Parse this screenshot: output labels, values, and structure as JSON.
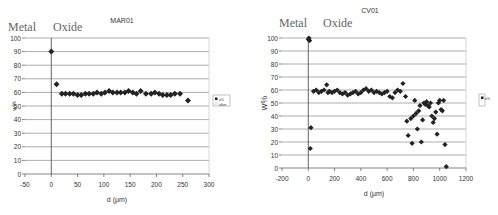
{
  "chart_data": [
    {
      "type": "scatter",
      "title": "MAR01",
      "xlabel": "d (µm)",
      "ylabel": "w%",
      "xlim": [
        -50,
        300
      ],
      "ylim": [
        0,
        100
      ],
      "xticks": [
        -50,
        0,
        50,
        100,
        150,
        200,
        250,
        300
      ],
      "yticks": [
        0,
        10,
        20,
        30,
        40,
        50,
        60,
        70,
        80,
        90,
        100
      ],
      "grid": true,
      "legend_position": "right",
      "legend": [
        "w%",
        "offset"
      ],
      "annotations": [
        "Metal",
        "Oxide"
      ],
      "series": [
        {
          "name": "w%",
          "x": [
            0,
            10,
            20,
            27,
            35,
            42,
            50,
            57,
            65,
            72,
            80,
            87,
            95,
            102,
            110,
            117,
            125,
            132,
            140,
            147,
            155,
            162,
            170,
            180,
            190,
            197,
            205,
            212,
            220,
            227,
            235,
            245,
            260
          ],
          "y": [
            90,
            66,
            59,
            59,
            59,
            59,
            58,
            58,
            59,
            59,
            59,
            60,
            59,
            60,
            61,
            60,
            60,
            60,
            60,
            61,
            60,
            59,
            61,
            59,
            59,
            60,
            59,
            58,
            58,
            58,
            59,
            59,
            54
          ]
        }
      ]
    },
    {
      "type": "scatter",
      "title": "CV01",
      "xlabel": "d (µm)",
      "ylabel": "w%",
      "xlim": [
        -200,
        1200
      ],
      "ylim": [
        0,
        100
      ],
      "xticks": [
        -200,
        0,
        200,
        400,
        600,
        800,
        1000,
        1200
      ],
      "yticks": [
        0,
        10,
        20,
        30,
        40,
        50,
        60,
        70,
        80,
        90,
        100
      ],
      "grid": true,
      "legend_position": "right",
      "legend": [
        "w%"
      ],
      "annotations": [
        "Metal",
        "Oxide"
      ],
      "series": [
        {
          "name": "w%",
          "x": [
            0,
            5,
            10,
            15,
            20,
            40,
            60,
            80,
            100,
            120,
            140,
            150,
            160,
            180,
            200,
            220,
            240,
            260,
            280,
            300,
            320,
            340,
            360,
            380,
            400,
            420,
            440,
            460,
            480,
            500,
            520,
            540,
            560,
            580,
            600,
            620,
            640,
            660,
            680,
            700,
            720,
            740,
            750,
            760,
            780,
            790,
            800,
            810,
            820,
            830,
            840,
            850,
            860,
            870,
            880,
            890,
            900,
            910,
            920,
            930,
            940,
            950,
            960,
            970,
            980,
            990,
            1000,
            1010,
            1020,
            1030,
            1040,
            1050
          ],
          "y": [
            99,
            100,
            98,
            15,
            31,
            59,
            60,
            58,
            59,
            60,
            64,
            58,
            59,
            58,
            59,
            60,
            58,
            57,
            58,
            56,
            57,
            58,
            59,
            57,
            58,
            60,
            61,
            59,
            60,
            58,
            59,
            58,
            57,
            58,
            59,
            55,
            54,
            58,
            60,
            59,
            65,
            55,
            36,
            25,
            38,
            19,
            40,
            52,
            42,
            30,
            44,
            48,
            20,
            37,
            50,
            49,
            51,
            48,
            47,
            50,
            40,
            35,
            38,
            43,
            26,
            50,
            52,
            45,
            44,
            52,
            18,
            1
          ]
        }
      ]
    }
  ]
}
